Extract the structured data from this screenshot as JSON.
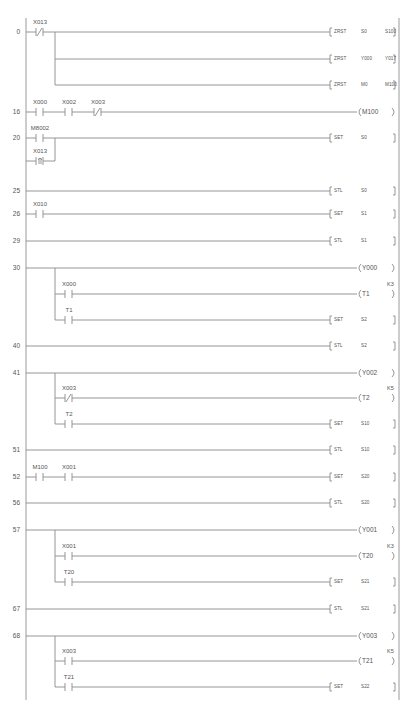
{
  "diagram": {
    "type": "ladder-diagram",
    "rungs": [
      {
        "step": "0",
        "y": 32,
        "contacts": [
          {
            "label": "X013",
            "type": "NC",
            "x": 40
          }
        ],
        "outputs": [
          {
            "kind": "instr",
            "op": "ZRST",
            "args": [
              "S0",
              "S100"
            ],
            "y": 32
          },
          {
            "kind": "instr",
            "op": "ZRST",
            "args": [
              "Y000",
              "Y017"
            ],
            "y": 59
          },
          {
            "kind": "instr",
            "op": "ZRST",
            "args": [
              "M0",
              "M100"
            ],
            "y": 85
          }
        ]
      },
      {
        "step": "16",
        "y": 112,
        "contacts": [
          {
            "label": "X000",
            "type": "NO",
            "x": 40
          },
          {
            "label": "X002",
            "type": "NO",
            "x": 69
          },
          {
            "label": "X003",
            "type": "NC",
            "x": 98
          }
        ],
        "outputs": [
          {
            "kind": "coil",
            "op": "M100",
            "y": 112
          }
        ]
      },
      {
        "step": "20",
        "y": 138,
        "contacts": [
          {
            "label": "M8002",
            "type": "NO",
            "x": 40
          },
          {
            "label": "X013",
            "type": "PLS",
            "x": 40,
            "branch_y": 161
          }
        ],
        "outputs": [
          {
            "kind": "instr",
            "op": "SET",
            "args": [
              "S0"
            ],
            "y": 138
          }
        ]
      },
      {
        "step": "25",
        "y": 191,
        "contacts": [],
        "outputs": [
          {
            "kind": "instr",
            "op": "STL",
            "args": [
              "S0"
            ],
            "y": 191
          }
        ]
      },
      {
        "step": "26",
        "y": 214,
        "contacts": [
          {
            "label": "X010",
            "type": "NO",
            "x": 40
          }
        ],
        "outputs": [
          {
            "kind": "instr",
            "op": "SET",
            "args": [
              "S1"
            ],
            "y": 214
          }
        ]
      },
      {
        "step": "29",
        "y": 241,
        "contacts": [],
        "outputs": [
          {
            "kind": "instr",
            "op": "STL",
            "args": [
              "S1"
            ],
            "y": 241
          }
        ]
      },
      {
        "step": "30",
        "y": 268,
        "contacts": [
          {
            "label": "X000",
            "type": "NO",
            "x": 69,
            "branch_y": 294
          },
          {
            "label": "T1",
            "type": "NO",
            "x": 69,
            "branch_y": 320
          }
        ],
        "outputs": [
          {
            "kind": "coil",
            "op": "Y000",
            "y": 268
          },
          {
            "kind": "coil",
            "op": "T1",
            "k": "K3",
            "y": 294
          },
          {
            "kind": "instr",
            "op": "SET",
            "args": [
              "S2"
            ],
            "y": 320
          }
        ]
      },
      {
        "step": "40",
        "y": 346,
        "contacts": [],
        "outputs": [
          {
            "kind": "instr",
            "op": "STL",
            "args": [
              "S2"
            ],
            "y": 346
          }
        ]
      },
      {
        "step": "41",
        "y": 373,
        "contacts": [
          {
            "label": "X003",
            "type": "NC",
            "x": 69,
            "branch_y": 398
          },
          {
            "label": "T2",
            "type": "NO",
            "x": 69,
            "branch_y": 424
          }
        ],
        "outputs": [
          {
            "kind": "coil",
            "op": "Y002",
            "y": 373
          },
          {
            "kind": "coil",
            "op": "T2",
            "k": "K5",
            "y": 398
          },
          {
            "kind": "instr",
            "op": "SET",
            "args": [
              "S10"
            ],
            "y": 424
          }
        ]
      },
      {
        "step": "51",
        "y": 450,
        "contacts": [],
        "outputs": [
          {
            "kind": "instr",
            "op": "STL",
            "args": [
              "S10"
            ],
            "y": 450
          }
        ]
      },
      {
        "step": "52",
        "y": 477,
        "contacts": [
          {
            "label": "M100",
            "type": "NO",
            "x": 40
          },
          {
            "label": "X001",
            "type": "NO",
            "x": 69
          }
        ],
        "outputs": [
          {
            "kind": "instr",
            "op": "SET",
            "args": [
              "S20"
            ],
            "y": 477
          }
        ]
      },
      {
        "step": "56",
        "y": 503,
        "contacts": [],
        "outputs": [
          {
            "kind": "instr",
            "op": "STL",
            "args": [
              "S20"
            ],
            "y": 503
          }
        ]
      },
      {
        "step": "57",
        "y": 530,
        "contacts": [
          {
            "label": "X001",
            "type": "NO",
            "x": 69,
            "branch_y": 556
          },
          {
            "label": "T20",
            "type": "NO",
            "x": 69,
            "branch_y": 582
          }
        ],
        "outputs": [
          {
            "kind": "coil",
            "op": "Y001",
            "y": 530
          },
          {
            "kind": "coil",
            "op": "T20",
            "k": "K3",
            "y": 556
          },
          {
            "kind": "instr",
            "op": "SET",
            "args": [
              "S21"
            ],
            "y": 582
          }
        ]
      },
      {
        "step": "67",
        "y": 609,
        "contacts": [],
        "outputs": [
          {
            "kind": "instr",
            "op": "STL",
            "args": [
              "S21"
            ],
            "y": 609
          }
        ]
      },
      {
        "step": "68",
        "y": 636,
        "contacts": [
          {
            "label": "X003",
            "type": "NO",
            "x": 69,
            "branch_y": 661
          },
          {
            "label": "T21",
            "type": "NO",
            "x": 69,
            "branch_y": 687
          }
        ],
        "outputs": [
          {
            "kind": "coil",
            "op": "Y003",
            "y": 636
          },
          {
            "kind": "coil",
            "op": "T21",
            "k": "K5",
            "y": 661
          },
          {
            "kind": "instr",
            "op": "SET",
            "args": [
              "S22"
            ],
            "y": 687
          }
        ]
      }
    ]
  }
}
